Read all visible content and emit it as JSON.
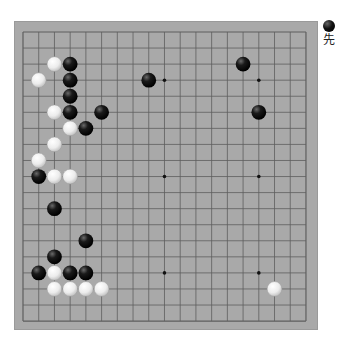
{
  "board": {
    "size": 19,
    "colors": {
      "board": "#a9a9a9",
      "line": "#5e5e5e",
      "black_stone": "#111111",
      "white_stone": "#f2f2f2"
    },
    "star_points": [
      [
        3,
        3
      ],
      [
        9,
        3
      ],
      [
        15,
        3
      ],
      [
        3,
        9
      ],
      [
        9,
        9
      ],
      [
        15,
        9
      ],
      [
        3,
        15
      ],
      [
        9,
        15
      ],
      [
        15,
        15
      ]
    ],
    "stones": [
      {
        "color": "white",
        "col": 2,
        "row": 2
      },
      {
        "color": "black",
        "col": 3,
        "row": 2
      },
      {
        "color": "black",
        "col": 14,
        "row": 2
      },
      {
        "color": "white",
        "col": 1,
        "row": 3
      },
      {
        "color": "black",
        "col": 3,
        "row": 3
      },
      {
        "color": "black",
        "col": 8,
        "row": 3
      },
      {
        "color": "black",
        "col": 3,
        "row": 4
      },
      {
        "color": "white",
        "col": 2,
        "row": 5
      },
      {
        "color": "black",
        "col": 3,
        "row": 5
      },
      {
        "color": "black",
        "col": 5,
        "row": 5
      },
      {
        "color": "black",
        "col": 15,
        "row": 5
      },
      {
        "color": "white",
        "col": 3,
        "row": 6
      },
      {
        "color": "black",
        "col": 4,
        "row": 6
      },
      {
        "color": "white",
        "col": 2,
        "row": 7
      },
      {
        "color": "white",
        "col": 1,
        "row": 8
      },
      {
        "color": "black",
        "col": 1,
        "row": 9
      },
      {
        "color": "white",
        "col": 2,
        "row": 9
      },
      {
        "color": "white",
        "col": 3,
        "row": 9
      },
      {
        "color": "black",
        "col": 2,
        "row": 11
      },
      {
        "color": "black",
        "col": 4,
        "row": 13
      },
      {
        "color": "black",
        "col": 2,
        "row": 14
      },
      {
        "color": "black",
        "col": 1,
        "row": 15
      },
      {
        "color": "white",
        "col": 2,
        "row": 15
      },
      {
        "color": "black",
        "col": 3,
        "row": 15
      },
      {
        "color": "black",
        "col": 4,
        "row": 15
      },
      {
        "color": "white",
        "col": 2,
        "row": 16
      },
      {
        "color": "white",
        "col": 3,
        "row": 16
      },
      {
        "color": "white",
        "col": 4,
        "row": 16
      },
      {
        "color": "white",
        "col": 5,
        "row": 16
      },
      {
        "color": "white",
        "col": 16,
        "row": 16
      }
    ]
  },
  "turn_indicator": {
    "stone_color": "black",
    "label": "先"
  }
}
